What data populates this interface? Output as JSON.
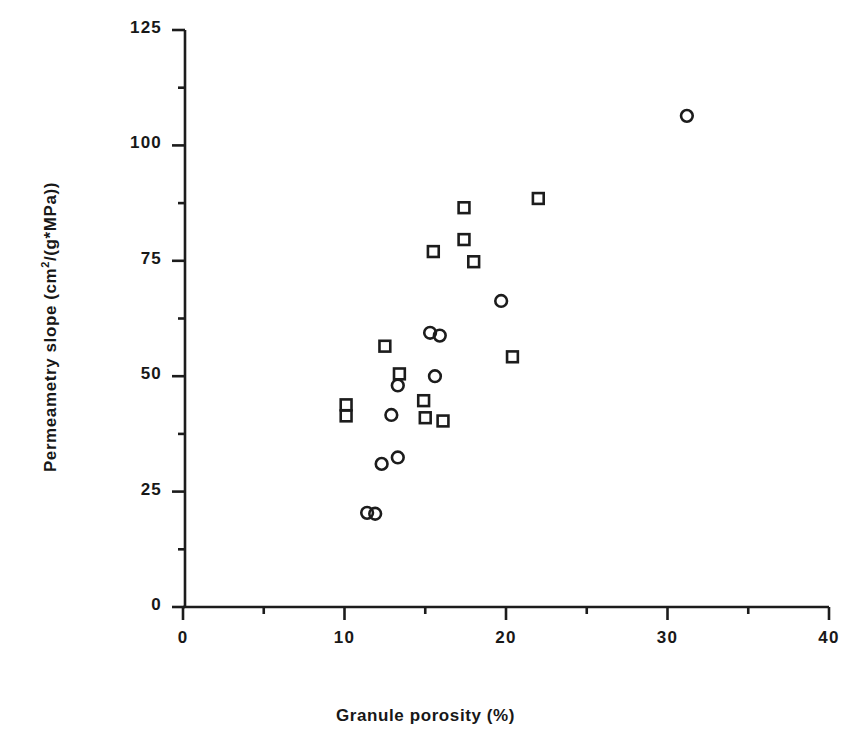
{
  "chart_data": {
    "type": "scatter",
    "title": "",
    "xlabel": "Granule porosity (%)",
    "ylabel": "Permeametry slope  (cm2/(g*MPa))",
    "ylabel_parts": {
      "prefix": "Permeametry  slope   (cm",
      "sup": "2",
      "suffix": "/(g*MPa))"
    },
    "xlim": [
      0,
      40
    ],
    "ylim": [
      0,
      125
    ],
    "xticks": [
      0,
      10,
      20,
      30,
      40
    ],
    "xtick_labels": [
      "0",
      "10",
      "20",
      "30",
      "40"
    ],
    "yticks": [
      0,
      25,
      50,
      75,
      100,
      125
    ],
    "ytick_labels": [
      "0",
      "25",
      "50",
      "75",
      "100",
      "125"
    ],
    "x_minor_tick_step": 5,
    "y_minor_tick_step": 12.5,
    "grid": false,
    "legend": null,
    "axis_style": "left-and-bottom-spine",
    "series": [
      {
        "name": "circle-series",
        "marker": "circle",
        "points": [
          [
            31.2,
            106.4
          ],
          [
            19.7,
            66.3
          ],
          [
            15.3,
            59.4
          ],
          [
            15.9,
            58.8
          ],
          [
            15.6,
            50.0
          ],
          [
            13.3,
            48.0
          ],
          [
            12.9,
            41.6
          ],
          [
            13.3,
            32.4
          ],
          [
            12.3,
            31.0
          ],
          [
            11.4,
            20.4
          ],
          [
            11.9,
            20.2
          ]
        ]
      },
      {
        "name": "square-series",
        "marker": "square",
        "points": [
          [
            22.0,
            88.5
          ],
          [
            17.4,
            86.5
          ],
          [
            17.4,
            79.6
          ],
          [
            18.0,
            74.8
          ],
          [
            15.5,
            77.0
          ],
          [
            20.4,
            54.2
          ],
          [
            12.5,
            56.5
          ],
          [
            13.4,
            50.5
          ],
          [
            14.9,
            44.7
          ],
          [
            15.0,
            41.0
          ],
          [
            16.1,
            40.3
          ],
          [
            10.1,
            43.8
          ],
          [
            10.1,
            41.4
          ]
        ]
      }
    ]
  },
  "colors": {
    "ink": "#1c1c1c",
    "background": "#ffffff"
  }
}
